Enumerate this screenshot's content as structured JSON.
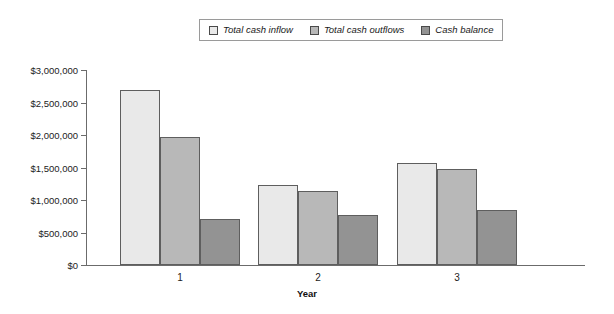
{
  "chart_data": {
    "type": "bar",
    "title": "",
    "xlabel": "Year",
    "ylabel": "",
    "categories": [
      "1",
      "2",
      "3"
    ],
    "series": [
      {
        "name": "Total cash inflow",
        "color": "#e9e9e9",
        "values": [
          2700000,
          1230000,
          1570000
        ]
      },
      {
        "name": "Total cash outflows",
        "color": "#b8b8b8",
        "values": [
          1970000,
          1140000,
          1480000
        ]
      },
      {
        "name": "Cash balance",
        "color": "#939393",
        "values": [
          710000,
          770000,
          850000
        ]
      }
    ],
    "ylim": [
      0,
      3000000
    ],
    "yticks": [
      {
        "value": 0,
        "label": "$0"
      },
      {
        "value": 500000,
        "label": "$500,000"
      },
      {
        "value": 1000000,
        "label": "$1,000,000"
      },
      {
        "value": 1500000,
        "label": "$1,500,000"
      },
      {
        "value": 2000000,
        "label": "$2,000,000"
      },
      {
        "value": 2500000,
        "label": "$2,500,000"
      },
      {
        "value": 3000000,
        "label": "$3,000,000"
      }
    ],
    "grid": false,
    "legend_position": "top-center",
    "legend_entries": [
      "Total cash inflow",
      "Total cash outflows",
      "Cash balance"
    ]
  }
}
